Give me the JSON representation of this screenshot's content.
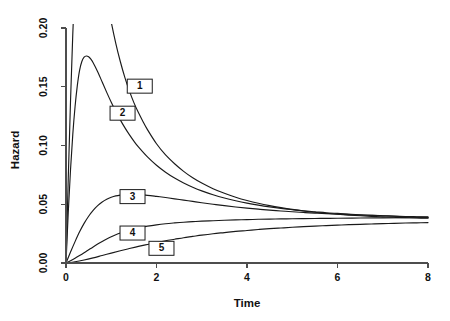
{
  "chart_data": {
    "type": "line",
    "title": "",
    "xlabel": "Time",
    "ylabel": "Hazard",
    "xlim": [
      0,
      8
    ],
    "ylim": [
      0,
      0.2
    ],
    "xticks": [
      0,
      2,
      4,
      6,
      8
    ],
    "xtick_labels": [
      "0",
      "2",
      "4",
      "6",
      "8"
    ],
    "yticks": [
      0.0,
      0.05,
      0.1,
      0.15,
      0.2
    ],
    "ytick_labels": [
      "0.00",
      "0.05",
      "0.10",
      "0.15",
      "0.20"
    ],
    "grid": false,
    "legend_position": "inline-boxed-labels",
    "line_color": "#1a1a1a",
    "axis_color": "#4d4d4d",
    "background": "#ffffff",
    "annotations": [
      {
        "label": "1",
        "x": 1.63,
        "y": 0.1505
      },
      {
        "label": "2",
        "x": 1.25,
        "y": 0.1275
      },
      {
        "label": "3",
        "x": 1.47,
        "y": 0.0565
      },
      {
        "label": "4",
        "x": 1.47,
        "y": 0.0255
      },
      {
        "label": "5",
        "x": 2.11,
        "y": 0.0125
      }
    ],
    "series": [
      {
        "name": "1",
        "label": "1",
        "points": [
          [
            0.0,
            0.0
          ],
          [
            0.05,
            0.072
          ],
          [
            0.1,
            0.138
          ],
          [
            0.15,
            0.195
          ],
          [
            0.2,
            0.242
          ],
          [
            0.25,
            0.279
          ],
          [
            0.3,
            0.306
          ],
          [
            0.35,
            0.323
          ],
          [
            0.4,
            0.331
          ],
          [
            0.5,
            0.328
          ],
          [
            0.6,
            0.306
          ],
          [
            0.7,
            0.279
          ],
          [
            0.8,
            0.252
          ],
          [
            0.88,
            0.232
          ],
          [
            0.94,
            0.218
          ],
          [
            1.0,
            0.205
          ],
          [
            1.1,
            0.187
          ],
          [
            1.2,
            0.1715
          ],
          [
            1.3,
            0.158
          ],
          [
            1.4,
            0.1465
          ],
          [
            1.5,
            0.1365
          ],
          [
            1.6,
            0.128
          ],
          [
            1.7,
            0.1205
          ],
          [
            1.8,
            0.1135
          ],
          [
            2.0,
            0.1015
          ],
          [
            2.2,
            0.092
          ],
          [
            2.4,
            0.0845
          ],
          [
            2.6,
            0.078
          ],
          [
            2.8,
            0.0725
          ],
          [
            3.0,
            0.068
          ],
          [
            3.25,
            0.0632
          ],
          [
            3.5,
            0.0593
          ],
          [
            3.75,
            0.056
          ],
          [
            4.0,
            0.0532
          ],
          [
            4.25,
            0.0508
          ],
          [
            4.5,
            0.0488
          ],
          [
            4.75,
            0.0471
          ],
          [
            5.0,
            0.0456
          ],
          [
            5.25,
            0.0443
          ],
          [
            5.5,
            0.0432
          ],
          [
            5.75,
            0.0423
          ],
          [
            6.0,
            0.0415
          ],
          [
            6.25,
            0.0408
          ],
          [
            6.5,
            0.0402
          ],
          [
            6.75,
            0.0397
          ],
          [
            7.0,
            0.0393
          ],
          [
            7.25,
            0.0389
          ],
          [
            7.5,
            0.0386
          ],
          [
            7.75,
            0.0383
          ],
          [
            8.0,
            0.0381
          ]
        ]
      },
      {
        "name": "2",
        "label": "2",
        "points": [
          [
            0.0,
            0.0
          ],
          [
            0.05,
            0.043
          ],
          [
            0.1,
            0.0795
          ],
          [
            0.15,
            0.1095
          ],
          [
            0.2,
            0.133
          ],
          [
            0.25,
            0.151
          ],
          [
            0.3,
            0.164
          ],
          [
            0.35,
            0.1715
          ],
          [
            0.4,
            0.1752
          ],
          [
            0.45,
            0.1762
          ],
          [
            0.5,
            0.1755
          ],
          [
            0.55,
            0.1735
          ],
          [
            0.6,
            0.1705
          ],
          [
            0.7,
            0.1628
          ],
          [
            0.8,
            0.154
          ],
          [
            0.9,
            0.1452
          ],
          [
            1.0,
            0.1368
          ],
          [
            1.1,
            0.129
          ],
          [
            1.2,
            0.1218
          ],
          [
            1.3,
            0.1152
          ],
          [
            1.4,
            0.1092
          ],
          [
            1.5,
            0.1037
          ],
          [
            1.6,
            0.0988
          ],
          [
            1.8,
            0.0903
          ],
          [
            2.0,
            0.0832
          ],
          [
            2.2,
            0.0773
          ],
          [
            2.4,
            0.0723
          ],
          [
            2.6,
            0.0681
          ],
          [
            2.8,
            0.0645
          ],
          [
            3.0,
            0.0614
          ],
          [
            3.25,
            0.0581
          ],
          [
            3.5,
            0.0553
          ],
          [
            3.75,
            0.053
          ],
          [
            4.0,
            0.051
          ],
          [
            4.25,
            0.0493
          ],
          [
            4.5,
            0.0478
          ],
          [
            4.75,
            0.0465
          ],
          [
            5.0,
            0.0454
          ],
          [
            5.25,
            0.0444
          ],
          [
            5.5,
            0.0436
          ],
          [
            5.75,
            0.0428
          ],
          [
            6.0,
            0.0422
          ],
          [
            6.25,
            0.0416
          ],
          [
            6.5,
            0.0411
          ],
          [
            6.75,
            0.0406
          ],
          [
            7.0,
            0.0402
          ],
          [
            7.25,
            0.0398
          ],
          [
            7.5,
            0.0394
          ],
          [
            7.75,
            0.0391
          ],
          [
            8.0,
            0.0388
          ]
        ]
      },
      {
        "name": "3",
        "label": "3",
        "points": [
          [
            0.0,
            0.0
          ],
          [
            0.1,
            0.0093
          ],
          [
            0.2,
            0.0182
          ],
          [
            0.3,
            0.0265
          ],
          [
            0.4,
            0.0337
          ],
          [
            0.5,
            0.0398
          ],
          [
            0.6,
            0.0448
          ],
          [
            0.7,
            0.0488
          ],
          [
            0.8,
            0.0519
          ],
          [
            0.9,
            0.0542
          ],
          [
            1.0,
            0.0559
          ],
          [
            1.1,
            0.0571
          ],
          [
            1.2,
            0.0578
          ],
          [
            1.3,
            0.0582
          ],
          [
            1.4,
            0.0584
          ],
          [
            1.5,
            0.0584
          ],
          [
            1.6,
            0.0582
          ],
          [
            1.8,
            0.0576
          ],
          [
            2.0,
            0.0567
          ],
          [
            2.2,
            0.0557
          ],
          [
            2.4,
            0.0546
          ],
          [
            2.6,
            0.0535
          ],
          [
            2.8,
            0.0524
          ],
          [
            3.0,
            0.0513
          ],
          [
            3.25,
            0.05
          ],
          [
            3.5,
            0.0488
          ],
          [
            3.75,
            0.0477
          ],
          [
            4.0,
            0.0467
          ],
          [
            4.25,
            0.0458
          ],
          [
            4.5,
            0.045
          ],
          [
            4.75,
            0.0443
          ],
          [
            5.0,
            0.0436
          ],
          [
            5.25,
            0.043
          ],
          [
            5.5,
            0.0425
          ],
          [
            5.75,
            0.042
          ],
          [
            6.0,
            0.0416
          ],
          [
            6.25,
            0.0412
          ],
          [
            6.5,
            0.0408
          ],
          [
            6.75,
            0.0405
          ],
          [
            7.0,
            0.0402
          ],
          [
            7.25,
            0.0399
          ],
          [
            7.5,
            0.0396
          ],
          [
            7.75,
            0.0394
          ],
          [
            8.0,
            0.0392
          ]
        ]
      },
      {
        "name": "4",
        "label": "4",
        "points": [
          [
            0.0,
            0.0
          ],
          [
            0.1,
            0.0019
          ],
          [
            0.2,
            0.004
          ],
          [
            0.3,
            0.0063
          ],
          [
            0.4,
            0.0087
          ],
          [
            0.5,
            0.0112
          ],
          [
            0.6,
            0.0137
          ],
          [
            0.7,
            0.0161
          ],
          [
            0.8,
            0.0184
          ],
          [
            0.9,
            0.0205
          ],
          [
            1.0,
            0.0224
          ],
          [
            1.1,
            0.0241
          ],
          [
            1.2,
            0.0256
          ],
          [
            1.3,
            0.0269
          ],
          [
            1.4,
            0.0281
          ],
          [
            1.5,
            0.0291
          ],
          [
            1.6,
            0.03
          ],
          [
            1.8,
            0.0314
          ],
          [
            2.0,
            0.0325
          ],
          [
            2.2,
            0.0334
          ],
          [
            2.4,
            0.0341
          ],
          [
            2.6,
            0.0347
          ],
          [
            2.8,
            0.0352
          ],
          [
            3.0,
            0.0356
          ],
          [
            3.25,
            0.036
          ],
          [
            3.5,
            0.0364
          ],
          [
            3.75,
            0.0367
          ],
          [
            4.0,
            0.0369
          ],
          [
            4.25,
            0.0372
          ],
          [
            4.5,
            0.0374
          ],
          [
            4.75,
            0.0375
          ],
          [
            5.0,
            0.0377
          ],
          [
            5.25,
            0.0378
          ],
          [
            5.5,
            0.0379
          ],
          [
            5.75,
            0.038
          ],
          [
            6.0,
            0.0381
          ],
          [
            6.5,
            0.0383
          ],
          [
            7.0,
            0.0384
          ],
          [
            7.5,
            0.0385
          ],
          [
            8.0,
            0.0386
          ]
        ]
      },
      {
        "name": "5",
        "label": "5",
        "points": [
          [
            0.0,
            0.0
          ],
          [
            0.2,
            0.0011
          ],
          [
            0.4,
            0.0026
          ],
          [
            0.6,
            0.0044
          ],
          [
            0.8,
            0.0064
          ],
          [
            1.0,
            0.0084
          ],
          [
            1.2,
            0.0104
          ],
          [
            1.4,
            0.0123
          ],
          [
            1.6,
            0.0141
          ],
          [
            1.8,
            0.0158
          ],
          [
            2.0,
            0.0174
          ],
          [
            2.2,
            0.0189
          ],
          [
            2.4,
            0.0202
          ],
          [
            2.6,
            0.0215
          ],
          [
            2.8,
            0.0226
          ],
          [
            3.0,
            0.0237
          ],
          [
            3.25,
            0.0249
          ],
          [
            3.5,
            0.0259
          ],
          [
            3.75,
            0.0269
          ],
          [
            4.0,
            0.0277
          ],
          [
            4.25,
            0.0285
          ],
          [
            4.5,
            0.0292
          ],
          [
            4.75,
            0.0298
          ],
          [
            5.0,
            0.0304
          ],
          [
            5.25,
            0.0309
          ],
          [
            5.5,
            0.0314
          ],
          [
            5.75,
            0.0318
          ],
          [
            6.0,
            0.0322
          ],
          [
            6.25,
            0.0326
          ],
          [
            6.5,
            0.0329
          ],
          [
            6.75,
            0.0332
          ],
          [
            7.0,
            0.0335
          ],
          [
            7.25,
            0.0337
          ],
          [
            7.5,
            0.034
          ],
          [
            7.75,
            0.0342
          ],
          [
            8.0,
            0.0344
          ]
        ]
      }
    ]
  }
}
